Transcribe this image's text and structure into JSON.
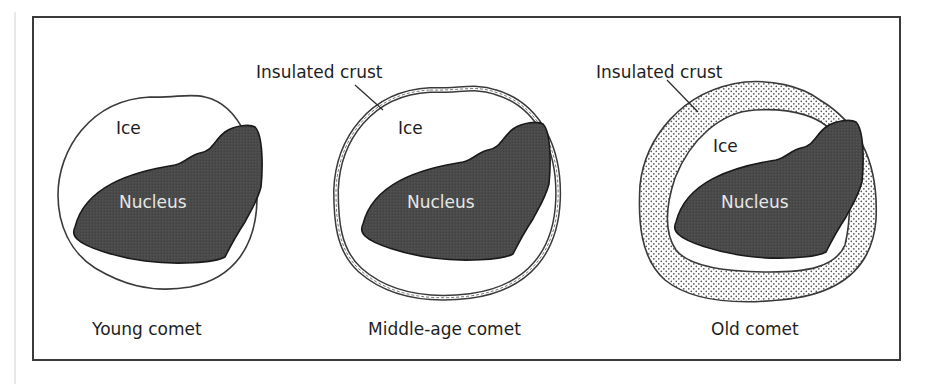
{
  "figure": {
    "panels": [
      {
        "id": "young",
        "caption": "Young comet",
        "layers": {
          "ice": "Ice",
          "nucleus": "Nucleus"
        },
        "crust": null
      },
      {
        "id": "middle-age",
        "caption": "Middle-age comet",
        "layers": {
          "ice": "Ice",
          "nucleus": "Nucleus"
        },
        "crust": "Insulated crust"
      },
      {
        "id": "old",
        "caption": "Old comet",
        "layers": {
          "ice": "Ice",
          "nucleus": "Nucleus"
        },
        "crust": "Insulated crust"
      }
    ],
    "colors": {
      "nucleus_fill": "#4a4a4a",
      "nucleus_text": "#e6e6e6",
      "outline": "#3a3a3a",
      "crust_dots": "#555555",
      "frame": "#3a3a3a"
    }
  }
}
